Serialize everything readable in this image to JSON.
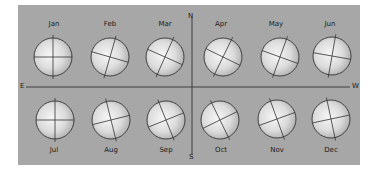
{
  "diagram": {
    "title": "",
    "colors": {
      "panel_background": "#a7a7a7",
      "globe_highlight": "#f4f4f4",
      "globe_shadow": "#b4b4b4",
      "line": "#333333"
    },
    "axes": {
      "north": "N",
      "south": "S",
      "east": "E",
      "west": "W"
    },
    "months": [
      {
        "label": "Jan",
        "row": "top",
        "cx": 53,
        "cy": 57,
        "axis_tilt_deg": 0
      },
      {
        "label": "Feb",
        "row": "top",
        "cx": 110,
        "cy": 57,
        "axis_tilt_deg": 16
      },
      {
        "label": "Mar",
        "row": "top",
        "cx": 165,
        "cy": 57,
        "axis_tilt_deg": 24
      },
      {
        "label": "Apr",
        "row": "top",
        "cx": 223,
        "cy": 57,
        "axis_tilt_deg": 26
      },
      {
        "label": "May",
        "row": "top",
        "cx": 280,
        "cy": 57,
        "axis_tilt_deg": 20
      },
      {
        "label": "Jun",
        "row": "top",
        "cx": 332,
        "cy": 56,
        "axis_tilt_deg": 10
      },
      {
        "label": "Jul",
        "row": "bottom",
        "cx": 55,
        "cy": 120,
        "axis_tilt_deg": 0
      },
      {
        "label": "Aug",
        "row": "bottom",
        "cx": 111,
        "cy": 120,
        "axis_tilt_deg": -14
      },
      {
        "label": "Sep",
        "row": "bottom",
        "cx": 166,
        "cy": 120,
        "axis_tilt_deg": -22
      },
      {
        "label": "Oct",
        "row": "bottom",
        "cx": 220,
        "cy": 120,
        "axis_tilt_deg": -26
      },
      {
        "label": "Nov",
        "row": "bottom",
        "cx": 277,
        "cy": 119,
        "axis_tilt_deg": -20
      },
      {
        "label": "Dec",
        "row": "bottom",
        "cx": 331,
        "cy": 119,
        "axis_tilt_deg": -12
      }
    ]
  }
}
